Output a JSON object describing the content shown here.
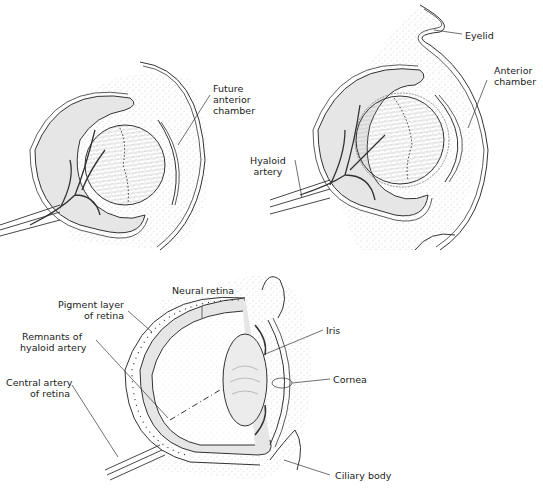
{
  "panels": [
    {
      "id": "early",
      "labels": [
        {
          "key": "future_anterior_chamber",
          "lines": [
            "Future",
            "anterior",
            "chamber"
          ]
        }
      ]
    },
    {
      "id": "middle",
      "labels": [
        {
          "key": "eyelid",
          "lines": [
            "Eyelid"
          ]
        },
        {
          "key": "anterior_chamber",
          "lines": [
            "Anterior",
            "chamber"
          ]
        },
        {
          "key": "hyaloid_artery",
          "lines": [
            "Hyaloid",
            "artery"
          ]
        }
      ]
    },
    {
      "id": "mature",
      "labels": [
        {
          "key": "neural_retina",
          "lines": [
            "Neural retina"
          ]
        },
        {
          "key": "pigment_layer",
          "lines": [
            "Pigment layer",
            "of retina"
          ]
        },
        {
          "key": "remnants_hyaloid",
          "lines": [
            "Remnants of",
            "hyaloid artery"
          ]
        },
        {
          "key": "central_artery",
          "lines": [
            "Central artery",
            "of retina"
          ]
        },
        {
          "key": "iris",
          "lines": [
            "Iris"
          ]
        },
        {
          "key": "cornea",
          "lines": [
            "Cornea"
          ]
        },
        {
          "key": "ciliary_body",
          "lines": [
            "Ciliary body"
          ]
        }
      ]
    }
  ],
  "text": {
    "future_anterior_chamber": "Future\nanterior\nchamber",
    "fac1": "Future",
    "fac2": "anterior",
    "fac3": "chamber",
    "eyelid": "Eyelid",
    "ac1": "Anterior",
    "ac2": "chamber",
    "ha1": "Hyaloid",
    "ha2": "artery",
    "neural_retina": "Neural retina",
    "pl1": "Pigment layer",
    "pl2": "of retina",
    "rh1": "Remnants of",
    "rh2": "hyaloid artery",
    "ca1": "Central artery",
    "ca2": "of retina",
    "iris": "Iris",
    "cornea": "Cornea",
    "ciliary_body": "Ciliary body"
  },
  "colors": {
    "line": "#333333",
    "fill_gray": "#e6e6e6",
    "stipple": "#999999",
    "background": "#ffffff"
  }
}
